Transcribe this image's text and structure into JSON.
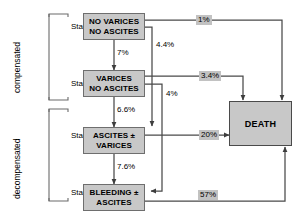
{
  "diagram": {
    "colors": {
      "box_fill": "#c8c8c8",
      "box_border": "#6e6e6e",
      "label_fill": "#c2c2c2",
      "line": "#4a4a4a",
      "background": "#ffffff"
    }
  },
  "groups": [
    {
      "id": "compensated",
      "label": "compensated"
    },
    {
      "id": "decompensated",
      "label": "decompensated"
    }
  ],
  "stages": [
    {
      "id": "stage-1",
      "label": "Stage 1",
      "box_lines": [
        "NO VARICES",
        "NO ASCITES"
      ]
    },
    {
      "id": "stage-2",
      "label": "Stage 2",
      "box_lines": [
        "VARICES",
        "NO ASCITES"
      ]
    },
    {
      "id": "stage-3",
      "label": "Stage 3",
      "box_lines": [
        "ASCITES  ±",
        "VARICES"
      ]
    },
    {
      "id": "stage-4",
      "label": "Stage 4",
      "box_lines": [
        "BLEEDING  ±",
        "ASCITES"
      ]
    }
  ],
  "terminal": {
    "id": "death",
    "label": "DEATH"
  },
  "transitions": [
    {
      "id": "s1-to-s2",
      "from": "stage-1",
      "to": "stage-2",
      "value": "7%",
      "shaded": false
    },
    {
      "id": "s2-to-s3",
      "from": "stage-2",
      "to": "stage-3",
      "value": "6.6%",
      "shaded": false
    },
    {
      "id": "s3-to-s4",
      "from": "stage-3",
      "to": "stage-4",
      "value": "7.6%",
      "shaded": false
    },
    {
      "id": "s1-to-s3",
      "from": "stage-1",
      "to": "stage-3",
      "value": "4.4%",
      "shaded": false
    },
    {
      "id": "s2-to-s4",
      "from": "stage-2",
      "to": "stage-4",
      "value": "4%",
      "shaded": false
    },
    {
      "id": "s1-to-death",
      "from": "stage-1",
      "to": "death",
      "value": "1%",
      "shaded": true
    },
    {
      "id": "s2-to-death",
      "from": "stage-2",
      "to": "death",
      "value": "3.4%",
      "shaded": true
    },
    {
      "id": "s3-to-death",
      "from": "stage-3",
      "to": "death",
      "value": "20%",
      "shaded": true
    },
    {
      "id": "s4-to-death",
      "from": "stage-4",
      "to": "death",
      "value": "57%",
      "shaded": true
    }
  ]
}
